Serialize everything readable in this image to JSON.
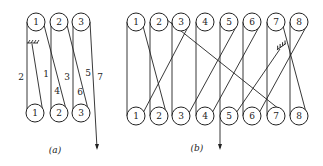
{
  "figure_a": {
    "caption": "(a)",
    "top_pulleys": [
      "1",
      "2",
      "3"
    ],
    "bottom_pulleys": [
      "1",
      "2",
      "3"
    ],
    "segment_labels": [
      "2",
      "1",
      "4",
      "3",
      "6",
      "5",
      "7"
    ]
  },
  "figure_b": {
    "caption": "(b)",
    "top_pulleys": [
      "1",
      "2",
      "3",
      "4",
      "5",
      "6",
      "7",
      "8"
    ],
    "bottom_pulleys": [
      "1",
      "2",
      "3",
      "4",
      "5",
      "6",
      "7",
      "8"
    ]
  },
  "colors": {
    "line": "#222222",
    "background": "#ffffff"
  }
}
